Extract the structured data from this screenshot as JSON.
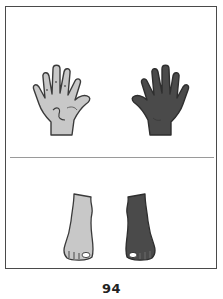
{
  "page": {
    "page_number": "94"
  },
  "panels": [
    {
      "name": "hands",
      "items": [
        {
          "label": "light hand",
          "icon": "hand-icon",
          "fill": "#c8c8c8",
          "stroke": "#3a3a3a"
        },
        {
          "label": "dark hand",
          "icon": "hand-icon",
          "fill": "#4a4a4a",
          "stroke": "#2e2e2e"
        }
      ]
    },
    {
      "name": "feet",
      "items": [
        {
          "label": "light foot",
          "icon": "foot-icon",
          "fill": "#c8c8c8",
          "stroke": "#3a3a3a"
        },
        {
          "label": "dark foot",
          "icon": "foot-icon",
          "fill": "#4a4a4a",
          "stroke": "#2e2e2e"
        }
      ]
    }
  ],
  "colors": {
    "frame": "#4a4a4a",
    "divider": "#9a9a9a",
    "light_fill": "#c8c8c8",
    "dark_fill": "#4a4a4a"
  }
}
